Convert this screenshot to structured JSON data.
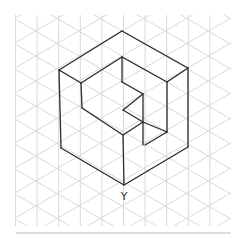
{
  "diagram": {
    "type": "isometric-sketch",
    "vertex_label": "Y",
    "colors": {
      "background": "#ffffff",
      "grid": "#d9d9d9",
      "stroke": "#2b2b2b",
      "rule": "#bdbdbd"
    },
    "grid": {
      "x0": 15.5,
      "x1": 231,
      "y0": 15,
      "y1": 226,
      "col_spacing": 21.6,
      "row_spacing": 25
    },
    "edges": [
      [
        122,
        31,
        59,
        70
      ],
      [
        122,
        31,
        188,
        68
      ],
      [
        59,
        70,
        81,
        83
      ],
      [
        188,
        68,
        167,
        82
      ],
      [
        122,
        57,
        81,
        83
      ],
      [
        122,
        57,
        167,
        82
      ],
      [
        59,
        70,
        61,
        148
      ],
      [
        188,
        68,
        188,
        147
      ],
      [
        61,
        148,
        124,
        185
      ],
      [
        188,
        147,
        124,
        185
      ],
      [
        122,
        57,
        122,
        82
      ],
      [
        81,
        83,
        82,
        108
      ],
      [
        167,
        82,
        167,
        132
      ],
      [
        122,
        82,
        143,
        94
      ],
      [
        143,
        94,
        143,
        145
      ],
      [
        143,
        94,
        123,
        110
      ],
      [
        123,
        110,
        143,
        122
      ],
      [
        82,
        108,
        123,
        135
      ],
      [
        123,
        135,
        143,
        122
      ],
      [
        143,
        122,
        167,
        132
      ],
      [
        167,
        132,
        145,
        145
      ],
      [
        123,
        135,
        124,
        185
      ]
    ]
  }
}
